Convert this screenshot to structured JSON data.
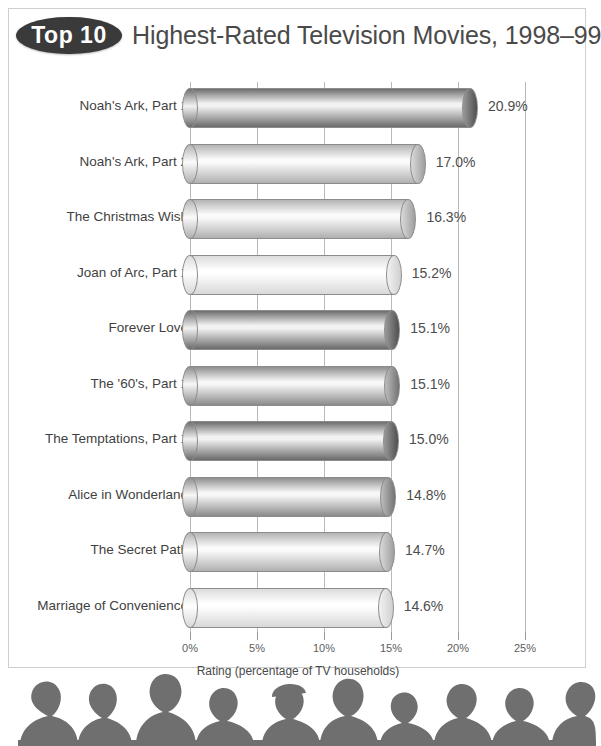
{
  "title": {
    "badge": "Top 10",
    "text": "Highest-Rated Television Movies, 1998–99"
  },
  "chart_data": {
    "type": "bar",
    "orientation": "horizontal",
    "title": "Top 10 Highest-Rated Television Movies, 1998–99",
    "xlabel": "Rating (percentage of TV households)",
    "ylabel": "",
    "xlim": [
      0,
      25
    ],
    "grid": true,
    "legend": false,
    "tick_labels": [
      "0%",
      "5%",
      "10%",
      "15%",
      "20%",
      "25%"
    ],
    "tick_values": [
      0,
      5,
      10,
      15,
      20,
      25
    ],
    "categories": [
      "Noah's Ark, Part 1",
      "Noah's Ark, Part 2",
      "The Christmas Wish",
      "Joan of Arc, Part 1",
      "Forever Love",
      "The '60's, Part 1",
      "The Temptations,  Part 1",
      "Alice in Wonderland",
      "The Secret Path",
      "Marriage of Convenience"
    ],
    "values": [
      20.9,
      17.0,
      16.3,
      15.2,
      15.1,
      15.1,
      15.0,
      14.8,
      14.7,
      14.6
    ],
    "value_labels": [
      "20.9%",
      "17.0%",
      "16.3%",
      "15.2%",
      "15.1%",
      "15.1%",
      "15.0%",
      "14.8%",
      "14.7%",
      "14.6%"
    ],
    "bar_tones": [
      "dark",
      "light",
      "light",
      "pale",
      "dark",
      "medium",
      "dark",
      "medium",
      "light",
      "pale"
    ]
  },
  "colors": {
    "badge_fill": "#3a3a3a",
    "badge_text": "#ffffff",
    "title_text": "#4a4a4a",
    "gridline": "#b9b9b9",
    "bar_outline": "#8c8c8c",
    "silhouette": "#6f6f6f",
    "background": "#ffffff",
    "frame": "#cfcfcf"
  },
  "footer": {
    "image_name": "audience-silhouette"
  }
}
